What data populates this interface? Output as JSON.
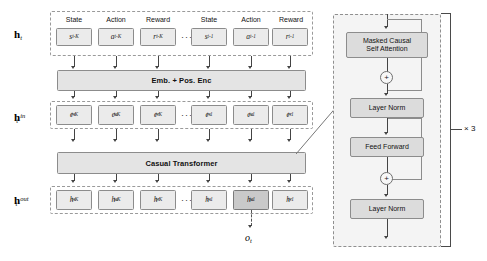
{
  "figure": {
    "repeat_label": "× 3",
    "ellipsis": "···",
    "plus_symbol": "+"
  },
  "rows": {
    "input": {
      "label_main": "h",
      "label_sub": "t",
      "label_sup": ""
    },
    "embedded": {
      "label_main": "h",
      "label_sub": "t",
      "label_sup": "in"
    },
    "output": {
      "label_main": "h",
      "label_sub": "t",
      "label_sup": "out"
    }
  },
  "column_headers": [
    {
      "name": "state-left",
      "text": "State"
    },
    {
      "name": "action-left",
      "text": "Action"
    },
    {
      "name": "reward-left",
      "text": "Reward"
    },
    {
      "name": "state-right",
      "text": "State"
    },
    {
      "name": "action-right",
      "text": "Action"
    },
    {
      "name": "reward-right",
      "text": "Reward"
    }
  ],
  "input_tokens": [
    {
      "base": "s",
      "sup": "",
      "sub": "t-K",
      "highlight": false
    },
    {
      "base": "a",
      "sup": "",
      "sub": "t-K",
      "highlight": false
    },
    {
      "base": "r",
      "sup": "",
      "sub": "t-K",
      "highlight": false
    },
    {
      "base": "s",
      "sup": "",
      "sub": "t-1",
      "highlight": false
    },
    {
      "base": "a",
      "sup": "",
      "sub": "t-1",
      "highlight": false
    },
    {
      "base": "r",
      "sup": "",
      "sub": "t-1",
      "highlight": false
    }
  ],
  "embedded_tokens": [
    {
      "base": "e",
      "sup": "s",
      "sub": "t-K",
      "highlight": false
    },
    {
      "base": "e",
      "sup": "a",
      "sub": "t-K",
      "highlight": false
    },
    {
      "base": "e",
      "sup": "r",
      "sub": "t-K",
      "highlight": false
    },
    {
      "base": "e",
      "sup": "s",
      "sub": "t-1",
      "highlight": false
    },
    {
      "base": "e",
      "sup": "a",
      "sub": "t-1",
      "highlight": false
    },
    {
      "base": "e",
      "sup": "r",
      "sub": "t-1",
      "highlight": false
    }
  ],
  "output_tokens": [
    {
      "base": "h",
      "sup": "s",
      "sub": "t-K",
      "highlight": false
    },
    {
      "base": "h",
      "sup": "a",
      "sub": "t-K",
      "highlight": false
    },
    {
      "base": "h",
      "sup": "r",
      "sub": "t-K",
      "highlight": false
    },
    {
      "base": "h",
      "sup": "s",
      "sub": "t-1",
      "highlight": false
    },
    {
      "base": "h",
      "sup": "a",
      "sub": "t-1",
      "highlight": true
    },
    {
      "base": "h",
      "sup": "r",
      "sub": "t-1",
      "highlight": false
    }
  ],
  "bars": {
    "embedding": "Emb. + Pos. Enc",
    "transformer": "Casual Transformer"
  },
  "final_output": {
    "base": "o",
    "sub": "t"
  },
  "panel_blocks": [
    {
      "name": "masked-causal-self-attention",
      "text": "Masked Causal\nSelf Attention"
    },
    {
      "name": "layer-norm-1",
      "text": "Layer Norm"
    },
    {
      "name": "feed-forward",
      "text": "Feed Forward"
    },
    {
      "name": "layer-norm-2",
      "text": "Layer Norm"
    }
  ],
  "colors": {
    "token_fill": "#ebebeb",
    "token_highlight_fill": "#c9c9c9",
    "bar_fill": "#e4e4e4",
    "panel_fill": "#f4f4f4",
    "panel_block_fill": "#dcdcdc",
    "stroke": "#8c8c8c",
    "dashed_stroke": "#9a9a9a"
  }
}
